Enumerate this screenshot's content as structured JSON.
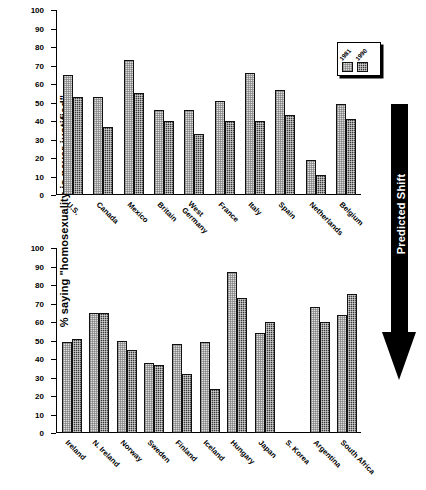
{
  "figure": {
    "ylabel": "% saying \"homosexuality is never justified\"",
    "annotation": "Predicted Shift"
  },
  "legend": {
    "series1": "1981",
    "series2": "1990",
    "series1_color": "#dedede",
    "series2_color": "#3a3a3a"
  },
  "axis": {
    "ticks": [
      "100",
      "90",
      "80",
      "70",
      "60",
      "50",
      "40",
      "30",
      "20",
      "10",
      "0"
    ]
  },
  "chart_data": [
    {
      "type": "bar",
      "title": "",
      "panel": "top",
      "xlabel": "",
      "ylabel": "% saying \"homosexuality is never justified\"",
      "ylim": [
        0,
        100
      ],
      "grid": false,
      "legend_position": "top-right",
      "categories": [
        "U.S.",
        "Canada",
        "Mexico",
        "Britain",
        "West\nGermany",
        "France",
        "Italy",
        "Spain",
        "Netherlands",
        "Belgium"
      ],
      "series": [
        {
          "name": "1981",
          "values": [
            65,
            53,
            73,
            46,
            46,
            51,
            66,
            57,
            19,
            49
          ]
        },
        {
          "name": "1990",
          "values": [
            53,
            37,
            55,
            40,
            33,
            40,
            40,
            43,
            11,
            41
          ]
        }
      ]
    },
    {
      "type": "bar",
      "title": "",
      "panel": "bottom",
      "xlabel": "",
      "ylabel": "% saying \"homosexuality is never justified\"",
      "ylim": [
        0,
        100
      ],
      "grid": false,
      "legend_position": "none",
      "categories": [
        "Ireland",
        "N. Ireland",
        "Norway",
        "Sweden",
        "Finland",
        "Iceland",
        "Hungary",
        "Japan",
        "S. Korea",
        "Argentina",
        "South Africa"
      ],
      "series": [
        {
          "name": "1981",
          "values": [
            49,
            65,
            50,
            38,
            48,
            49,
            87,
            54,
            null,
            68,
            64
          ]
        },
        {
          "name": "1990",
          "values": [
            51,
            65,
            45,
            37,
            32,
            24,
            73,
            60,
            null,
            60,
            75
          ]
        }
      ]
    }
  ]
}
